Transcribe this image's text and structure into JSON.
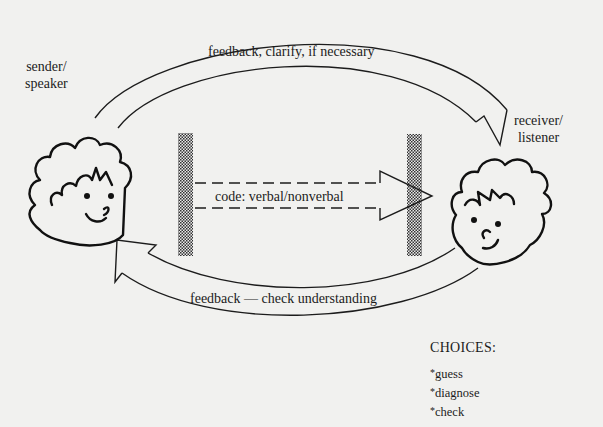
{
  "diagram": {
    "type": "communication-model",
    "sender": {
      "label_line1": "sender/",
      "label_line2": "speaker"
    },
    "receiver": {
      "label_line1": "receiver/",
      "label_line2": "listener"
    },
    "top_arrow": {
      "label": "feedback, clarify, if necessary",
      "direction": "sender-to-receiver"
    },
    "center_arrow": {
      "label": "code: verbal/nonverbal",
      "direction": "sender-to-receiver",
      "style": "dashed"
    },
    "bottom_arrow": {
      "label": "feedback — check understanding",
      "direction": "receiver-to-sender"
    },
    "barriers": [
      "left-barrier",
      "right-barrier"
    ],
    "choices": {
      "title": "CHOICES:",
      "items": [
        "guess",
        "diagnose",
        "check"
      ]
    }
  }
}
